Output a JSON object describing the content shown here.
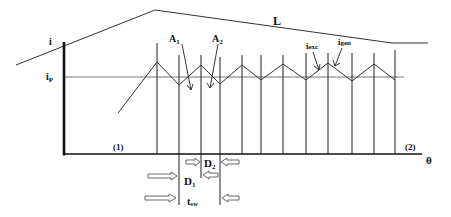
{
  "diagram": {
    "type": "switching-current-waveform",
    "colors": {
      "line": "#222222",
      "axis": "#111111",
      "ref_line": "#555555",
      "background": "#ffffff"
    },
    "labels": {
      "y_axis": "i",
      "reference_level_main": "i",
      "reference_level_sub": "P",
      "x_axis": "θ",
      "envelope": "L",
      "region_start": "(1)",
      "region_end": "(2)",
      "A1_main": "A",
      "A1_sub": "1",
      "A2_main": "A",
      "A2_sub": "2",
      "i_exc_main": "i",
      "i_exc_sub": "exc",
      "i_gen_main": "i",
      "i_gen_sub": "gen",
      "D1_main": "D",
      "D1_sub": "1",
      "D2_main": "D",
      "D2_sub": "2",
      "tsw_main": "t",
      "tsw_sub": "sw"
    },
    "geometry": {
      "y_axis": {
        "x": 64,
        "y_top": 42,
        "y_bottom": 155
      },
      "x_axis": {
        "y": 154,
        "x_start": 64,
        "x_end": 422
      },
      "ip_level": {
        "y": 77,
        "x_start": 64,
        "x_end": 404
      },
      "envelope_points": "16,65 155,10 392,43 428,43",
      "switching_lines": [
        {
          "x": 157,
          "top": 43
        },
        {
          "x": 179,
          "top": 55
        },
        {
          "x": 201,
          "top": 55
        },
        {
          "x": 220,
          "top": 57
        },
        {
          "x": 242,
          "top": 55
        },
        {
          "x": 261,
          "top": 55
        },
        {
          "x": 283,
          "top": 55
        },
        {
          "x": 306,
          "top": 53
        },
        {
          "x": 328,
          "top": 53
        },
        {
          "x": 352,
          "top": 53
        },
        {
          "x": 374,
          "top": 53
        },
        {
          "x": 395,
          "top": 50
        }
      ],
      "current_waveform_points": "118,113 157,62 179,85 201,65 220,84 242,65 261,80 283,64 306,80 328,63 352,81 374,64 395,80"
    }
  }
}
